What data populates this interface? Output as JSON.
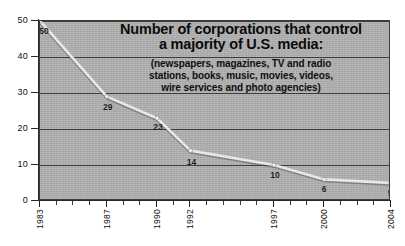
{
  "chart_data": {
    "type": "line",
    "title": "Number of corporations that control a majority of U.S. media:",
    "title_lines": [
      "Number of corporations that control",
      "a majority of U.S. media:"
    ],
    "subtitle": "(newspapers, magazines, TV and radio stations, books, music, movies, videos, wire services and photo agencies)",
    "subtitle_lines": [
      "(newspapers, magazines, TV and radio",
      "stations, books, music, movies, videos,",
      "wire services and photo agencies)"
    ],
    "xlabel": "",
    "ylabel": "",
    "x": [
      1983,
      1987,
      1990,
      1992,
      1997,
      2000,
      2004
    ],
    "values": [
      50,
      29,
      23,
      14,
      10,
      6,
      5
    ],
    "categories": [
      "1983",
      "1987",
      "1990",
      "1992",
      "1997",
      "2000",
      "2004"
    ],
    "point_labels": [
      "50",
      "29",
      "23",
      "14",
      "10",
      "6",
      "5"
    ],
    "xlim": [
      1983,
      2004
    ],
    "ylim": [
      0,
      50
    ],
    "yticks": [
      0,
      10,
      20,
      30,
      40,
      50
    ],
    "ytick_labels": [
      "0",
      "10",
      "20",
      "30",
      "40",
      "50"
    ],
    "xtick_years": [
      1983,
      1984,
      1985,
      1986,
      1987,
      1988,
      1989,
      1990,
      1991,
      1992,
      1993,
      1994,
      1995,
      1996,
      1997,
      1998,
      1999,
      2000,
      2001,
      2002,
      2003,
      2004
    ],
    "grid": true,
    "legend": "none",
    "series_color": "#f0f0f0",
    "marker_color": "#fafafa",
    "plot_background": "#b2b2b2",
    "gridline_color": "#3d3d3d",
    "axis_color": "#2a2a2a",
    "text_color": "#0e0e0e",
    "page_background": "#ffffff"
  }
}
